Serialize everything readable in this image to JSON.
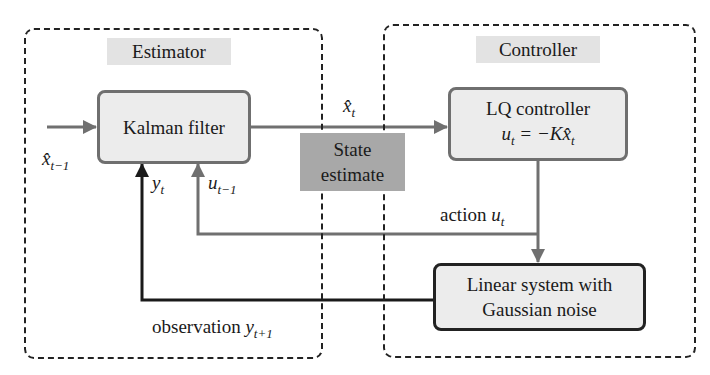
{
  "groups": {
    "estimator": {
      "label": "Estimator"
    },
    "controller": {
      "label": "Controller"
    }
  },
  "blocks": {
    "kalman_filter": {
      "label": "Kalman filter"
    },
    "lq_controller": {
      "label": "LQ controller",
      "equation_lhs": "u",
      "equation_lhs_sub": "t",
      "equation_rhs": " = −K",
      "equation_var": "x̂",
      "equation_var_sub": "t"
    },
    "linear_system": {
      "line1": "Linear system with",
      "line2": "Gaussian noise"
    },
    "state_estimate": {
      "line1": "State",
      "line2": "estimate"
    }
  },
  "signals": {
    "prev_estimate": {
      "var": "x̂",
      "sub": "t−1"
    },
    "current_estimate": {
      "var": "x̂",
      "sub": "t"
    },
    "observation_in": {
      "var": "y",
      "sub": "t"
    },
    "prev_action_in": {
      "var": "u",
      "sub": "t−1"
    },
    "action": {
      "text": "action ",
      "var": "u",
      "sub": "t"
    },
    "observation": {
      "text": "observation ",
      "var": "y",
      "sub": "t+1"
    }
  },
  "colors": {
    "gray_arrow": "#707070",
    "black_arrow": "#1a1a1a",
    "block_fill": "#ececec",
    "state_fill": "#a8a8a8",
    "label_fill": "#e3e3e3"
  }
}
